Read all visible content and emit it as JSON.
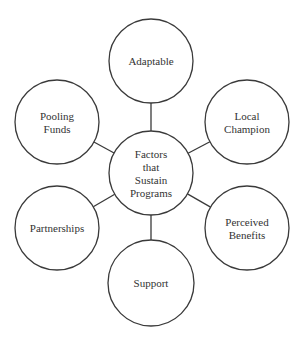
{
  "diagram": {
    "type": "hub-and-spoke",
    "center": {
      "id": "center",
      "lines": [
        "Factors",
        "that",
        "Sustain",
        "Programs"
      ],
      "cx": 151,
      "cy": 173,
      "r": 42
    },
    "nodes": [
      {
        "id": "adaptable",
        "lines": [
          "Adaptable"
        ],
        "cx": 151,
        "cy": 61,
        "r": 42
      },
      {
        "id": "local-champion",
        "lines": [
          "Local",
          "Champion"
        ],
        "cx": 247,
        "cy": 122,
        "r": 42
      },
      {
        "id": "perceived-benefits",
        "lines": [
          "Perceived",
          "Benefits"
        ],
        "cx": 247,
        "cy": 228,
        "r": 42
      },
      {
        "id": "support",
        "lines": [
          "Support"
        ],
        "cx": 151,
        "cy": 283,
        "r": 43
      },
      {
        "id": "partnerships",
        "lines": [
          "Partnerships"
        ],
        "cx": 57,
        "cy": 228,
        "r": 42
      },
      {
        "id": "pooling-funds",
        "lines": [
          "Pooling",
          "Funds"
        ],
        "cx": 57,
        "cy": 122,
        "r": 42
      }
    ],
    "edges": [
      [
        "center",
        "adaptable"
      ],
      [
        "center",
        "local-champion"
      ],
      [
        "center",
        "perceived-benefits"
      ],
      [
        "center",
        "support"
      ],
      [
        "center",
        "partnerships"
      ],
      [
        "center",
        "pooling-funds"
      ]
    ]
  }
}
